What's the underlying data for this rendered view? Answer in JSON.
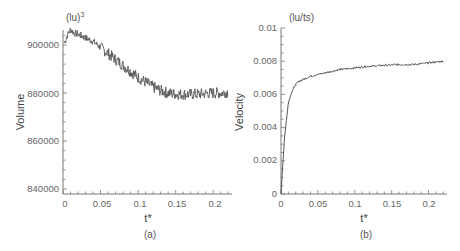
{
  "chart_data": [
    {
      "type": "line",
      "panel": "(a)",
      "title": "",
      "xlabel": "t*",
      "ylabel": "Volume",
      "y_unit": "(lu)3",
      "xlim": [
        0,
        0.22
      ],
      "ylim": [
        839000,
        910000
      ],
      "x_ticks": [
        "0",
        "0.05",
        "0.1",
        "0.15",
        "0.2"
      ],
      "y_ticks": [
        "840000",
        "860000",
        "880000",
        "900000"
      ],
      "grid": false,
      "series": [
        {
          "name": "Volume",
          "color": "#555555",
          "x": [
            0,
            0.005,
            0.01,
            0.015,
            0.02,
            0.03,
            0.04,
            0.05,
            0.06,
            0.07,
            0.08,
            0.09,
            0.1,
            0.11,
            0.12,
            0.13,
            0.14,
            0.15,
            0.16,
            0.17,
            0.18,
            0.19,
            0.2,
            0.21,
            0.22
          ],
          "y": [
            899000,
            903500,
            906500,
            905000,
            904500,
            903000,
            901500,
            899000,
            896500,
            894000,
            891500,
            889000,
            886500,
            884500,
            882500,
            881000,
            880000,
            879500,
            879500,
            879500,
            879500,
            879800,
            880000,
            880000,
            880500
          ]
        }
      ]
    },
    {
      "type": "line",
      "panel": "(b)",
      "title": "",
      "xlabel": "t*",
      "ylabel": "Velocity",
      "y_unit": "(lu/ts)",
      "xlim": [
        0,
        0.22
      ],
      "ylim": [
        0,
        0.01
      ],
      "x_ticks": [
        "0",
        "0.05",
        "0.1",
        "0.15",
        "0.2"
      ],
      "y_ticks": [
        "0",
        "0.002",
        "0.004",
        "0.006",
        "0.008",
        "0.01"
      ],
      "grid": false,
      "series": [
        {
          "name": "Velocity",
          "color": "#555555",
          "x": [
            0,
            0.002,
            0.005,
            0.01,
            0.015,
            0.02,
            0.025,
            0.03,
            0.04,
            0.05,
            0.06,
            0.08,
            0.1,
            0.12,
            0.14,
            0.16,
            0.18,
            0.2,
            0.22
          ],
          "y": [
            0,
            0.0015,
            0.0035,
            0.0055,
            0.0062,
            0.0066,
            0.0068,
            0.0069,
            0.0071,
            0.0072,
            0.0073,
            0.0075,
            0.0076,
            0.0077,
            0.00775,
            0.0078,
            0.0078,
            0.0079,
            0.008
          ]
        }
      ]
    }
  ],
  "panels": {
    "a": {
      "unit": "(lu)",
      "unit_sup": "3",
      "ylabel": "Volume",
      "xlabel": "t*",
      "caption": "(a)",
      "y_ticks": [
        "900000",
        "880000",
        "860000",
        "840000"
      ],
      "x_ticks": [
        "0",
        "0.05",
        "0.1",
        "0.15",
        "0.2"
      ]
    },
    "b": {
      "unit": "(lu/ts)",
      "ylabel": "Velocity",
      "xlabel": "t*",
      "caption": "(b)",
      "y_ticks": [
        "0.01",
        "0.008",
        "0.006",
        "0.004",
        "0.002",
        "0"
      ],
      "x_ticks": [
        "0",
        "0.05",
        "0.1",
        "0.15",
        "0.2"
      ]
    }
  }
}
